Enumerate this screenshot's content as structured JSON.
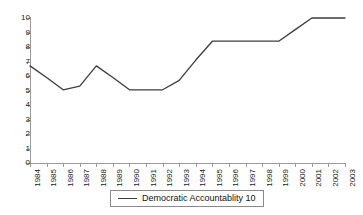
{
  "chart_data": {
    "type": "line",
    "title": "",
    "xlabel": "",
    "ylabel": "",
    "x": [
      1984,
      1985,
      1986,
      1987,
      1988,
      1989,
      1990,
      1991,
      1992,
      1993,
      1994,
      1995,
      1996,
      1997,
      1998,
      1999,
      2000,
      2001,
      2002,
      2003
    ],
    "xtick_labels": [
      "1984",
      "1985",
      "1986",
      "1987",
      "1988",
      "1989",
      "1990",
      "1991",
      "1992",
      "1993",
      "1994",
      "1995",
      "1996",
      "1997",
      "1998",
      "1999",
      "2000",
      "2001",
      "2002",
      "2003"
    ],
    "ytick_labels": [
      "0",
      "1",
      "2",
      "3",
      "4",
      "5",
      "6",
      "7",
      "8",
      "9",
      "10"
    ],
    "yticks": [
      0,
      1,
      2,
      3,
      4,
      5,
      6,
      7,
      8,
      9,
      10
    ],
    "ylim": [
      0,
      10
    ],
    "xlim": [
      1984,
      2003
    ],
    "grid": false,
    "legend_position": "bottom-center",
    "series": [
      {
        "name": "Democratic Accountablity 10",
        "color": "#3d3d3d",
        "values": [
          6.7,
          5.9,
          5.05,
          5.3,
          6.7,
          5.9,
          5.05,
          5.05,
          5.05,
          5.7,
          7.1,
          8.4,
          8.4,
          8.4,
          8.4,
          8.4,
          9.2,
          10.0,
          10.0,
          10.0
        ]
      }
    ]
  },
  "legend": {
    "entries": [
      {
        "label": "Democratic Accountablity 10"
      }
    ]
  },
  "colors": {
    "series_line": "#3d3d3d",
    "axis": "#9a9a9a",
    "text": "#1a1a1a",
    "legend_border": "#8a8a8a",
    "background": "#ffffff"
  }
}
